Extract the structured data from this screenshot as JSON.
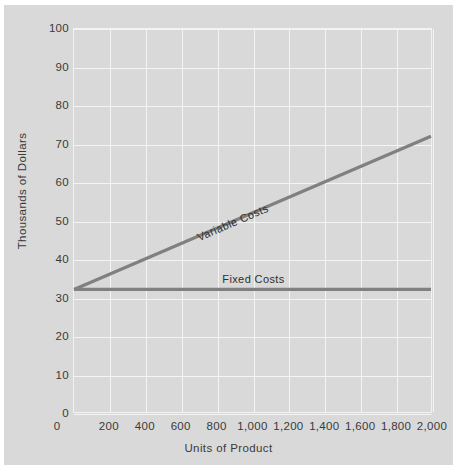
{
  "chart_data": {
    "type": "line",
    "title": "",
    "xlabel": "Units of Product",
    "ylabel": "Thousands of Dollars",
    "xlim": [
      0,
      2000
    ],
    "ylim": [
      0,
      100
    ],
    "grid": true,
    "legend_position": "inline-annotations",
    "x_ticks": [
      200,
      400,
      600,
      800,
      1000,
      1200,
      1400,
      1600,
      1800,
      2000
    ],
    "x_tick_labels": [
      "200",
      "400",
      "600",
      "800",
      "1,000",
      "1,200",
      "1,400",
      "1,600",
      "1,800",
      "2,000"
    ],
    "y_ticks": [
      0,
      10,
      20,
      30,
      40,
      50,
      60,
      70,
      80,
      90,
      100
    ],
    "y_tick_labels": [
      "0",
      "10",
      "20",
      "30",
      "40",
      "50",
      "60",
      "70",
      "80",
      "90",
      "100"
    ],
    "origin_label": "0",
    "series": [
      {
        "name": "Variable Costs",
        "annotation": "Variable Costs",
        "color": "#808080",
        "x": [
          0,
          2000
        ],
        "values": [
          32,
          72
        ]
      },
      {
        "name": "Fixed Costs",
        "annotation": "Fixed Costs",
        "color": "#808080",
        "x": [
          0,
          2000
        ],
        "values": [
          32,
          32
        ]
      }
    ]
  },
  "style": {
    "figure_background": "#d9d9d9",
    "plot_background": "#d9d9d9",
    "gridline_color": "#f4f4f4",
    "line_color": "#808080",
    "text_color": "#3a3a3a"
  }
}
